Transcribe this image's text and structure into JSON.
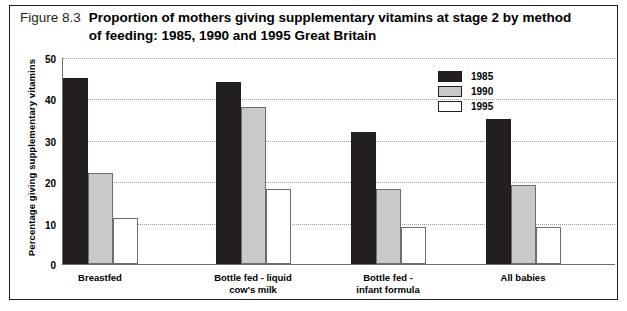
{
  "figure": {
    "number": "Figure 8.3",
    "title": "Proportion of mothers giving supplementary vitamins at stage 2 by method of feeding: 1985, 1990 and 1995 Great Britain"
  },
  "chart_data": {
    "type": "bar",
    "title": "Proportion of mothers giving supplementary vitamins at stage 2 by method of feeding: 1985, 1990 and 1995 Great Britain",
    "xlabel": "",
    "ylabel": "Percentage giving supplementary vitamins",
    "ylim": [
      0,
      50
    ],
    "yticks": [
      0,
      10,
      20,
      30,
      40,
      50
    ],
    "grid": true,
    "legend_position": "upper-right",
    "categories": [
      "Breastfed",
      "Bottle fed - liquid cow's milk",
      "Bottle fed - infant formula",
      "All babies"
    ],
    "category_lines": [
      [
        "Breastfed"
      ],
      [
        "Bottle fed - liquid",
        "cow's milk"
      ],
      [
        "Bottle fed -",
        "infant formula"
      ],
      [
        "All babies"
      ]
    ],
    "series": [
      {
        "name": "1985",
        "color": "#231f20",
        "values": [
          45,
          44,
          32,
          35
        ]
      },
      {
        "name": "1990",
        "color": "#c9c9c9",
        "values": [
          22,
          38,
          18,
          19
        ]
      },
      {
        "name": "1995",
        "color": "#ffffff",
        "values": [
          11,
          18,
          9,
          9
        ]
      }
    ]
  }
}
